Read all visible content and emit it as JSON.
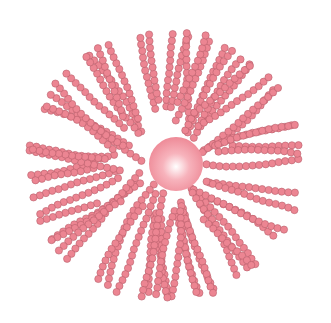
{
  "diagram": {
    "type": "polymer-brush-micelle",
    "width": 331,
    "height": 323,
    "core": {
      "cx": 176,
      "cy": 164,
      "r": 27,
      "color_center": "#ffffff",
      "color_mid": "#f7b3bc",
      "color_edge": "#ee8a97"
    },
    "bead": {
      "r": 3.6,
      "fill": "#ec8592",
      "stroke": "#b8606b",
      "spacing": 6.6
    },
    "chain_count": 62,
    "chains_rx": 150,
    "chains_ry": 148,
    "center": {
      "x": 165,
      "y": 165
    },
    "seed": 7
  }
}
